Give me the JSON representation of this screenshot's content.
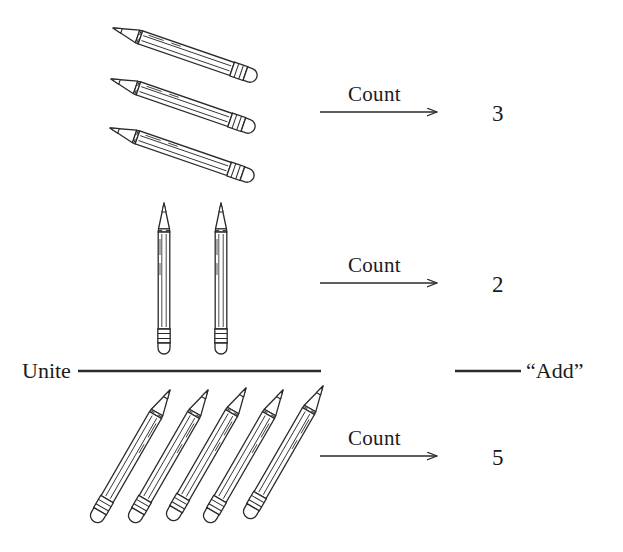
{
  "figure": {
    "background_color": "#ffffff",
    "ink_color": "#2a2a2a",
    "text_color": "#1b1b1b"
  },
  "labels": {
    "count": "Count",
    "unite": "Unite",
    "add": "“Add”"
  },
  "rows": [
    {
      "id": "row-top",
      "pencil_count": 3,
      "orientation": "diagonal-down-right",
      "arrow_label": "Count",
      "result": "3"
    },
    {
      "id": "row-middle",
      "pencil_count": 2,
      "orientation": "vertical",
      "arrow_label": "Count",
      "result": "2"
    },
    {
      "id": "row-bottom",
      "pencil_count": 5,
      "orientation": "diagonal-up-right",
      "arrow_label": "Count",
      "result": "5"
    }
  ],
  "operation": {
    "left_label": "Unite",
    "right_label": "“Add”",
    "operands": [
      3,
      2
    ],
    "sum": 5
  },
  "icons": {
    "pencil": "pencil-icon",
    "arrow": "arrow-right-icon",
    "rule": "horizontal-rule"
  }
}
